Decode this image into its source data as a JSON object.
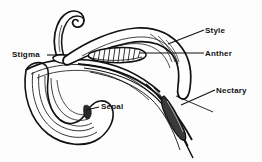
{
  "figure": {
    "kind": "botanical-line-diagram",
    "background_color": "#fdfdfd",
    "ink_color": "#111111",
    "labels": [
      {
        "id": "style",
        "text": "Style",
        "part": "style",
        "side": "right",
        "leader": "line-sloping-down-left"
      },
      {
        "id": "anther",
        "text": "Anther",
        "part": "anther",
        "side": "right",
        "leader": "line-horizontal-left"
      },
      {
        "id": "nectary",
        "text": "Nectary",
        "part": "nectary",
        "side": "right",
        "leader": "line-sloping-down-left"
      },
      {
        "id": "stigma",
        "text": "Stigma",
        "part": "stigma",
        "side": "left",
        "leader": "line-horizontal-right"
      },
      {
        "id": "sepal",
        "text": "Sepal",
        "part": "sepal",
        "side": "right",
        "leader": "line-horizontal-left"
      }
    ],
    "parts": {
      "style": "Style",
      "anther": "Anther",
      "nectary": "Nectary",
      "stigma": "Stigma",
      "sepal": "Sepal"
    }
  }
}
